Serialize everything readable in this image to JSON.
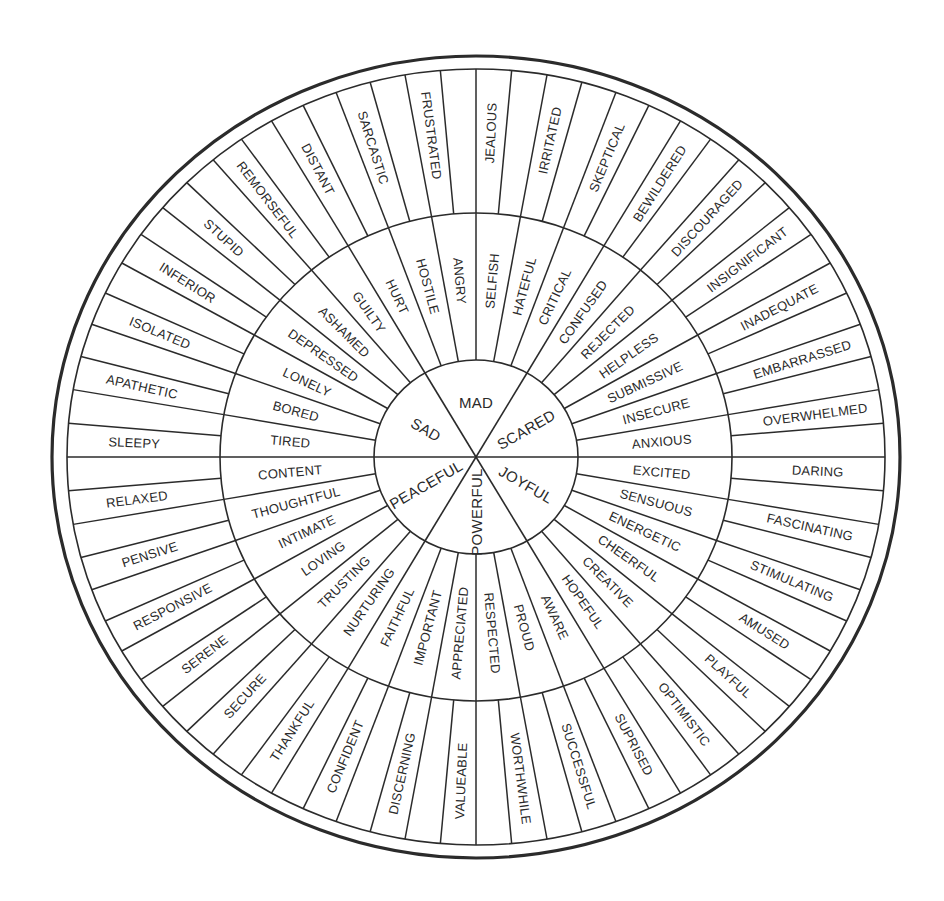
{
  "diagram": {
    "type": "feelings-wheel",
    "colors": {
      "ink": "#2b2b2b",
      "paper": "#ffffff"
    },
    "geometry": {
      "center": [
        476,
        457
      ],
      "outer_border": {
        "rx": 424,
        "ry": 401
      },
      "outer_ring": {
        "rx": 409,
        "ry": 388
      },
      "middle_ring": {
        "rx": 256,
        "ry": 244
      },
      "core": {
        "rx": 102,
        "ry": 97
      },
      "start_angle_deg": -30
    },
    "core": [
      {
        "label": "MAD"
      },
      {
        "label": "SCARED"
      },
      {
        "label": "JOYFUL"
      },
      {
        "label": "POWERFUL"
      },
      {
        "label": "PEACEFUL"
      },
      {
        "label": "SAD"
      }
    ],
    "middle": [
      "HURT",
      "HOSTILE",
      "ANGRY",
      "SELFISH",
      "HATEFUL",
      "CRITICAL",
      "CONFUSED",
      "REJECTED",
      "HELPLESS",
      "SUBMISSIVE",
      "INSECURE",
      "ANXIOUS",
      "EXCITED",
      "SENSUOUS",
      "ENERGETIC",
      "CHEERFUL",
      "CREATIVE",
      "HOPEFUL",
      "AWARE",
      "PROUD",
      "RESPECTED",
      "APPRECIATED",
      "IMPORTANT",
      "FAITHFUL",
      "NURTURING",
      "TRUSTING",
      "LOVING",
      "INTIMATE",
      "THOUGHTFUL",
      "CONTENT",
      "TIRED",
      "BORED",
      "LONELY",
      "DEPRESSED",
      "ASHAMED",
      "GUILTY"
    ],
    "outer": [
      "DISTANT",
      "",
      "SARCASTIC",
      "",
      "FRUSTRATED",
      "",
      "JEALOUS",
      "",
      "IRRITATED",
      "",
      "SKEPTICAL",
      "",
      "BEWILDERED",
      "",
      "DISCOURAGED",
      "",
      "INSIGNIFICANT",
      "",
      "INADEQUATE",
      "",
      "EMBARRASSED",
      "",
      "OVERWHELMED",
      "",
      "DARING",
      "",
      "FASCINATING",
      "",
      "STIMULATING",
      "",
      "AMUSED",
      "",
      "PLAYFUL",
      "",
      "OPTIMISTIC",
      "",
      "SUPRISED",
      "",
      "SUCCESSFUL",
      "",
      "WORTHWHILE",
      "",
      "VALUEABLE",
      "",
      "DISCERNING",
      "",
      "CONFIDENT",
      "",
      "THANKFUL",
      "",
      "SECURE",
      "",
      "SERENE",
      "",
      "RESPONSIVE",
      "",
      "PENSIVE",
      "",
      "RELAXED",
      "",
      "SLEEPY",
      "",
      "APATHETIC",
      "",
      "ISOLATED",
      "",
      "INFERIOR",
      "",
      "STUPID",
      "",
      "REMORSEFUL",
      ""
    ]
  }
}
